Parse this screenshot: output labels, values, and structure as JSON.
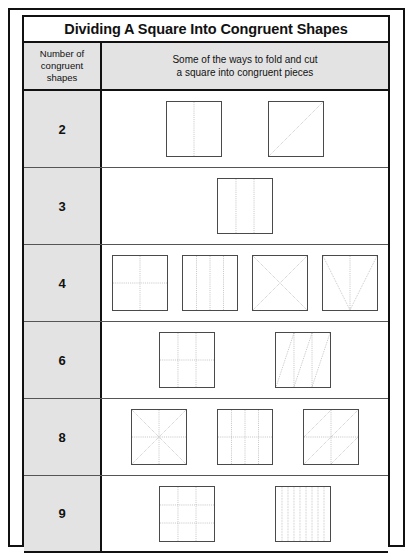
{
  "title": "Dividing A Square Into Congruent Shapes",
  "header": {
    "left_line1": "Number of",
    "left_line2": "congruent",
    "left_line3": "shapes",
    "right_line1": "Some of the ways to fold and cut",
    "right_line2": "a square into congruent pieces"
  },
  "colors": {
    "border": "#111111",
    "header_fill": "#e3e3e3",
    "square_outline": "#4a4a4a",
    "dotted_line": "#8d8d8d",
    "page_background": "#ffffff"
  },
  "rows": [
    {
      "count": "2",
      "gap": 46,
      "diagrams": [
        {
          "name": "square-vertical-half",
          "lines": [
            [
              50,
              0,
              50,
              100
            ]
          ]
        },
        {
          "name": "square-diagonal-half",
          "lines": [
            [
              0,
              100,
              100,
              0
            ]
          ]
        }
      ]
    },
    {
      "count": "3",
      "gap": 24,
      "diagrams": [
        {
          "name": "square-vertical-thirds",
          "lines": [
            [
              33.3,
              0,
              33.3,
              100
            ],
            [
              66.7,
              0,
              66.7,
              100
            ]
          ]
        }
      ]
    },
    {
      "count": "4",
      "gap": 14,
      "diagrams": [
        {
          "name": "square-quadrant-cross",
          "lines": [
            [
              50,
              0,
              50,
              100
            ],
            [
              0,
              50,
              100,
              50
            ]
          ]
        },
        {
          "name": "square-vertical-quarters",
          "lines": [
            [
              25,
              0,
              25,
              100
            ],
            [
              50,
              0,
              50,
              100
            ],
            [
              75,
              0,
              75,
              100
            ]
          ]
        },
        {
          "name": "square-diagonal-x",
          "lines": [
            [
              0,
              0,
              100,
              100
            ],
            [
              100,
              0,
              0,
              100
            ]
          ]
        },
        {
          "name": "square-v-fold",
          "lines": [
            [
              0,
              0,
              50,
              100
            ],
            [
              100,
              0,
              50,
              100
            ],
            [
              50,
              0,
              50,
              100
            ]
          ]
        }
      ]
    },
    {
      "count": "6",
      "gap": 60,
      "diagrams": [
        {
          "name": "square-grid-3x2",
          "lines": [
            [
              33.3,
              0,
              33.3,
              100
            ],
            [
              66.7,
              0,
              66.7,
              100
            ],
            [
              0,
              50,
              100,
              50
            ]
          ]
        },
        {
          "name": "square-slanted-triangles",
          "lines": [
            [
              33.3,
              0,
              33.3,
              100
            ],
            [
              66.7,
              0,
              66.7,
              100
            ],
            [
              33.3,
              0,
              0,
              100
            ],
            [
              66.7,
              0,
              33.3,
              100
            ],
            [
              100,
              0,
              66.7,
              100
            ]
          ]
        }
      ]
    },
    {
      "count": "8",
      "gap": 30,
      "diagrams": [
        {
          "name": "square-eight-triangles",
          "lines": [
            [
              0,
              0,
              100,
              100
            ],
            [
              100,
              0,
              0,
              100
            ],
            [
              50,
              0,
              50,
              100
            ],
            [
              0,
              50,
              100,
              50
            ]
          ]
        },
        {
          "name": "square-vertical-quarters-halved",
          "lines": [
            [
              25,
              0,
              25,
              100
            ],
            [
              50,
              0,
              50,
              100
            ],
            [
              75,
              0,
              75,
              100
            ],
            [
              0,
              50,
              100,
              50
            ]
          ]
        },
        {
          "name": "square-quadrant-diagonals",
          "lines": [
            [
              50,
              0,
              50,
              100
            ],
            [
              0,
              50,
              100,
              50
            ],
            [
              0,
              50,
              50,
              0
            ],
            [
              50,
              50,
              100,
              0
            ],
            [
              0,
              100,
              50,
              50
            ],
            [
              50,
              100,
              100,
              50
            ]
          ]
        }
      ]
    },
    {
      "count": "9",
      "gap": 60,
      "diagrams": [
        {
          "name": "square-grid-3x3",
          "lines": [
            [
              33.3,
              0,
              33.3,
              100
            ],
            [
              66.7,
              0,
              66.7,
              100
            ],
            [
              0,
              33.3,
              100,
              33.3
            ],
            [
              0,
              66.7,
              100,
              66.7
            ]
          ]
        },
        {
          "name": "square-vertical-ninths",
          "dense": true,
          "lines": [
            [
              11.1,
              0,
              11.1,
              100
            ],
            [
              22.2,
              0,
              22.2,
              100
            ],
            [
              33.3,
              0,
              33.3,
              100
            ],
            [
              44.4,
              0,
              44.4,
              100
            ],
            [
              55.6,
              0,
              55.6,
              100
            ],
            [
              66.7,
              0,
              66.7,
              100
            ],
            [
              77.8,
              0,
              77.8,
              100
            ],
            [
              88.9,
              0,
              88.9,
              100
            ]
          ]
        }
      ]
    }
  ]
}
